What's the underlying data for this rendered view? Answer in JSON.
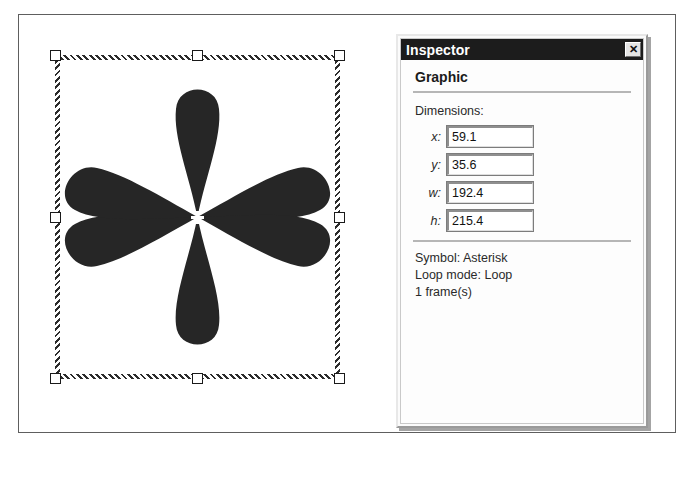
{
  "window": {
    "title": "Inspector",
    "close_icon": "close-icon",
    "close_glyph": "✕"
  },
  "inspector": {
    "section_heading": "Graphic",
    "dimensions_label": "Dimensions:",
    "fields": [
      {
        "label": "x:",
        "value": "59.1"
      },
      {
        "label": "y:",
        "value": "35.6"
      },
      {
        "label": "w:",
        "value": "192.4"
      },
      {
        "label": "h:",
        "value": "215.4"
      }
    ],
    "info_lines": [
      "Symbol: Asterisk",
      "Loop mode: Loop",
      "1 frame(s)"
    ]
  },
  "canvas": {
    "graphic_name": "Asterisk",
    "petal_count": 6,
    "fill_color": "#262626",
    "selection": {
      "handle_count": 8,
      "handle_fill": "#ffffff",
      "handle_stroke": "#1a1a1a",
      "center_marker": "crosshair"
    }
  },
  "colors": {
    "titlebar_bg": "#1c1c1c",
    "titlebar_text": "#ffffff",
    "panel_bg": "#fdfdfd",
    "graphic_fill": "#262626",
    "frame_border": "#5e5e5e"
  }
}
